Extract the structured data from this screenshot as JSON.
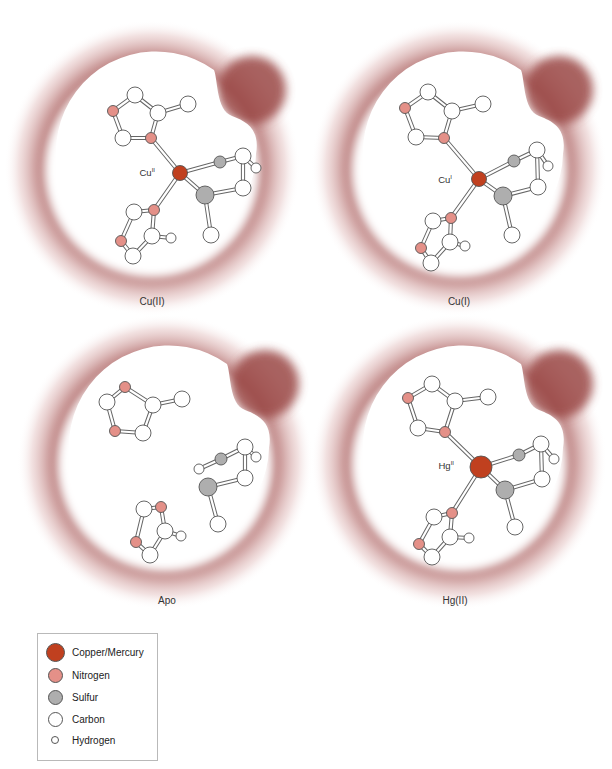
{
  "colors": {
    "metal": "#c0401f",
    "nitrogen": "#e49088",
    "sulfur": "#aeaeae",
    "carbon": "#ffffff",
    "hydrogen": "#ffffff",
    "outline": "#555555",
    "halo": "#9c4a48",
    "pocket": "#ffffff"
  },
  "panels": [
    {
      "id": "cu2",
      "label": "Cu(II)",
      "label_pos": [
        152,
        305
      ],
      "center": [
        152,
        168
      ],
      "metal_label": {
        "base": "Cu",
        "sup": "II",
        "pos": [
          155,
          176
        ]
      },
      "atoms": [
        {
          "el": "C",
          "x": 135,
          "y": 95
        },
        {
          "el": "N",
          "x": 113,
          "y": 111
        },
        {
          "el": "C",
          "x": 158,
          "y": 113
        },
        {
          "el": "C",
          "x": 188,
          "y": 104
        },
        {
          "el": "C",
          "x": 123,
          "y": 138
        },
        {
          "el": "N",
          "x": 151,
          "y": 138
        },
        {
          "el": "M",
          "x": 180,
          "y": 173,
          "r": 7.5
        },
        {
          "el": "S2",
          "x": 220,
          "y": 162
        },
        {
          "el": "C",
          "x": 243,
          "y": 156
        },
        {
          "el": "H",
          "x": 256,
          "y": 168
        },
        {
          "el": "C",
          "x": 243,
          "y": 188
        },
        {
          "el": "S",
          "x": 205,
          "y": 195
        },
        {
          "el": "C",
          "x": 211,
          "y": 235
        },
        {
          "el": "N",
          "x": 154,
          "y": 210
        },
        {
          "el": "C",
          "x": 134,
          "y": 212
        },
        {
          "el": "N",
          "x": 121,
          "y": 241
        },
        {
          "el": "C",
          "x": 152,
          "y": 236
        },
        {
          "el": "H",
          "x": 171,
          "y": 238
        },
        {
          "el": "C",
          "x": 133,
          "y": 256
        }
      ],
      "bonds": [
        [
          0,
          1
        ],
        [
          0,
          2
        ],
        [
          2,
          3
        ],
        [
          1,
          4
        ],
        [
          4,
          5
        ],
        [
          5,
          2
        ],
        [
          5,
          6
        ],
        [
          6,
          7
        ],
        [
          7,
          8
        ],
        [
          8,
          9
        ],
        [
          8,
          10
        ],
        [
          10,
          11
        ],
        [
          6,
          11
        ],
        [
          11,
          12
        ],
        [
          6,
          13
        ],
        [
          13,
          14
        ],
        [
          14,
          15
        ],
        [
          13,
          16
        ],
        [
          16,
          17
        ],
        [
          15,
          18
        ],
        [
          18,
          16
        ]
      ]
    },
    {
      "id": "cu1",
      "label": "Cu(I)",
      "label_pos": [
        459,
        305
      ],
      "center": [
        459,
        168
      ],
      "metal_label": {
        "base": "Cu",
        "sup": "I",
        "pos": [
          452,
          183
        ]
      },
      "atoms": [
        {
          "el": "C",
          "x": 428,
          "y": 92
        },
        {
          "el": "N",
          "x": 405,
          "y": 108
        },
        {
          "el": "C",
          "x": 452,
          "y": 111
        },
        {
          "el": "C",
          "x": 483,
          "y": 104
        },
        {
          "el": "C",
          "x": 416,
          "y": 137
        },
        {
          "el": "N",
          "x": 444,
          "y": 138
        },
        {
          "el": "M",
          "x": 479,
          "y": 179,
          "r": 7.5
        },
        {
          "el": "S2",
          "x": 514,
          "y": 161
        },
        {
          "el": "C",
          "x": 537,
          "y": 150
        },
        {
          "el": "H",
          "x": 548,
          "y": 166
        },
        {
          "el": "C",
          "x": 538,
          "y": 187
        },
        {
          "el": "S",
          "x": 503,
          "y": 196
        },
        {
          "el": "C",
          "x": 512,
          "y": 235
        },
        {
          "el": "N",
          "x": 451,
          "y": 218
        },
        {
          "el": "C",
          "x": 433,
          "y": 221
        },
        {
          "el": "N",
          "x": 421,
          "y": 248
        },
        {
          "el": "C",
          "x": 450,
          "y": 242
        },
        {
          "el": "H",
          "x": 465,
          "y": 246
        },
        {
          "el": "C",
          "x": 431,
          "y": 263
        }
      ],
      "bonds": [
        [
          0,
          1
        ],
        [
          0,
          2
        ],
        [
          2,
          3
        ],
        [
          1,
          4
        ],
        [
          4,
          5
        ],
        [
          5,
          2
        ],
        [
          5,
          6
        ],
        [
          6,
          7
        ],
        [
          7,
          8
        ],
        [
          8,
          9
        ],
        [
          8,
          10
        ],
        [
          10,
          11
        ],
        [
          6,
          11
        ],
        [
          11,
          12
        ],
        [
          6,
          13
        ],
        [
          13,
          14
        ],
        [
          14,
          15
        ],
        [
          13,
          16
        ],
        [
          16,
          17
        ],
        [
          15,
          18
        ],
        [
          18,
          16
        ]
      ]
    },
    {
      "id": "apo",
      "label": "Apo",
      "label_pos": [
        167,
        604
      ],
      "center": [
        165,
        462
      ],
      "metal_label": null,
      "atoms": [
        {
          "el": "N",
          "x": 125,
          "y": 387
        },
        {
          "el": "C",
          "x": 107,
          "y": 402
        },
        {
          "el": "C",
          "x": 153,
          "y": 405
        },
        {
          "el": "C",
          "x": 182,
          "y": 399
        },
        {
          "el": "N",
          "x": 115,
          "y": 431
        },
        {
          "el": "C",
          "x": 143,
          "y": 433
        },
        {
          "el": "H",
          "x": 199,
          "y": 469
        },
        {
          "el": "S2",
          "x": 221,
          "y": 459
        },
        {
          "el": "C",
          "x": 245,
          "y": 447
        },
        {
          "el": "H",
          "x": 256,
          "y": 457
        },
        {
          "el": "C",
          "x": 245,
          "y": 478
        },
        {
          "el": "S",
          "x": 208,
          "y": 487
        },
        {
          "el": "C",
          "x": 218,
          "y": 524
        },
        {
          "el": "N",
          "x": 161,
          "y": 507
        },
        {
          "el": "C",
          "x": 144,
          "y": 509
        },
        {
          "el": "N",
          "x": 136,
          "y": 542
        },
        {
          "el": "C",
          "x": 165,
          "y": 531
        },
        {
          "el": "H",
          "x": 181,
          "y": 536
        },
        {
          "el": "C",
          "x": 150,
          "y": 555
        }
      ],
      "bonds": [
        [
          0,
          1
        ],
        [
          0,
          2
        ],
        [
          2,
          3
        ],
        [
          1,
          4
        ],
        [
          4,
          5
        ],
        [
          5,
          2
        ],
        [
          6,
          7
        ],
        [
          7,
          8
        ],
        [
          8,
          9
        ],
        [
          8,
          10
        ],
        [
          10,
          11
        ],
        [
          11,
          12
        ],
        [
          13,
          14
        ],
        [
          14,
          15
        ],
        [
          13,
          16
        ],
        [
          16,
          17
        ],
        [
          15,
          18
        ],
        [
          18,
          16
        ]
      ]
    },
    {
      "id": "hg2",
      "label": "Hg(II)",
      "label_pos": [
        455,
        604
      ],
      "center": [
        459,
        462
      ],
      "metal_label": {
        "base": "Hg",
        "sup": "II",
        "pos": [
          454,
          469
        ]
      },
      "atoms": [
        {
          "el": "C",
          "x": 432,
          "y": 384
        },
        {
          "el": "N",
          "x": 408,
          "y": 398
        },
        {
          "el": "C",
          "x": 455,
          "y": 401
        },
        {
          "el": "C",
          "x": 488,
          "y": 397
        },
        {
          "el": "C",
          "x": 418,
          "y": 428
        },
        {
          "el": "N",
          "x": 445,
          "y": 432
        },
        {
          "el": "M",
          "x": 481,
          "y": 467,
          "r": 11
        },
        {
          "el": "S2",
          "x": 519,
          "y": 455
        },
        {
          "el": "C",
          "x": 541,
          "y": 444
        },
        {
          "el": "H",
          "x": 554,
          "y": 459
        },
        {
          "el": "C",
          "x": 542,
          "y": 479
        },
        {
          "el": "S",
          "x": 505,
          "y": 490
        },
        {
          "el": "C",
          "x": 515,
          "y": 527
        },
        {
          "el": "N",
          "x": 452,
          "y": 513
        },
        {
          "el": "C",
          "x": 434,
          "y": 517
        },
        {
          "el": "N",
          "x": 419,
          "y": 544
        },
        {
          "el": "C",
          "x": 450,
          "y": 537
        },
        {
          "el": "H",
          "x": 469,
          "y": 538
        },
        {
          "el": "C",
          "x": 432,
          "y": 557
        }
      ],
      "bonds": [
        [
          0,
          1
        ],
        [
          0,
          2
        ],
        [
          2,
          3
        ],
        [
          1,
          4
        ],
        [
          4,
          5
        ],
        [
          5,
          2
        ],
        [
          5,
          6
        ],
        [
          6,
          7
        ],
        [
          7,
          8
        ],
        [
          8,
          9
        ],
        [
          8,
          10
        ],
        [
          10,
          11
        ],
        [
          6,
          11
        ],
        [
          11,
          12
        ],
        [
          6,
          13
        ],
        [
          13,
          14
        ],
        [
          14,
          15
        ],
        [
          13,
          16
        ],
        [
          16,
          17
        ],
        [
          15,
          18
        ],
        [
          18,
          16
        ]
      ]
    }
  ],
  "legend": {
    "items": [
      {
        "label": "Copper/Mercury",
        "element": "metal",
        "size": 19
      },
      {
        "label": "Nitrogen",
        "element": "nitrogen",
        "size": 15
      },
      {
        "label": "Sulfur",
        "element": "sulfur",
        "size": 15
      },
      {
        "label": "Carbon",
        "element": "carbon",
        "size": 15
      },
      {
        "label": "Hydrogen",
        "element": "hydrogen",
        "size": 8
      }
    ]
  }
}
